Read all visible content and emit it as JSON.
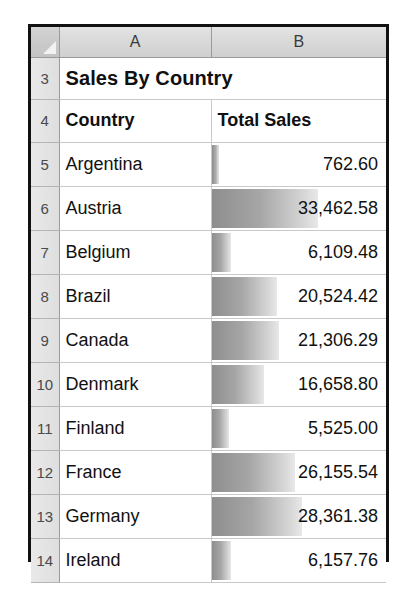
{
  "spreadsheet": {
    "corner": {
      "name": "select-all-corner"
    },
    "column_headers": [
      "A",
      "B"
    ],
    "title_row": {
      "row_number": "3",
      "title": "Sales By Country"
    },
    "header_row": {
      "row_number": "4",
      "columns": [
        "Country",
        "Total Sales"
      ]
    },
    "rows": [
      {
        "row_number": "5",
        "country": "Argentina",
        "total_sales": "762.60",
        "value": 762.6
      },
      {
        "row_number": "6",
        "country": "Austria",
        "total_sales": "33,462.58",
        "value": 33462.58
      },
      {
        "row_number": "7",
        "country": "Belgium",
        "total_sales": "6,109.48",
        "value": 6109.48
      },
      {
        "row_number": "8",
        "country": "Brazil",
        "total_sales": "20,524.42",
        "value": 20524.42
      },
      {
        "row_number": "9",
        "country": "Canada",
        "total_sales": "21,306.29",
        "value": 21306.29
      },
      {
        "row_number": "10",
        "country": "Denmark",
        "total_sales": "16,658.80",
        "value": 16658.8
      },
      {
        "row_number": "11",
        "country": "Finland",
        "total_sales": "5,525.00",
        "value": 5525.0
      },
      {
        "row_number": "12",
        "country": "France",
        "total_sales": "26,155.54",
        "value": 26155.54
      },
      {
        "row_number": "13",
        "country": "Germany",
        "total_sales": "28,361.38",
        "value": 28361.38
      },
      {
        "row_number": "14",
        "country": "Ireland",
        "total_sales": "6,157.76",
        "value": 6157.76
      }
    ],
    "databar": {
      "max_value": 33462.58,
      "max_width_percent": 61,
      "gradient_start_color": "#8e8e8e",
      "gradient_end_color": "#e8e8e8"
    }
  }
}
